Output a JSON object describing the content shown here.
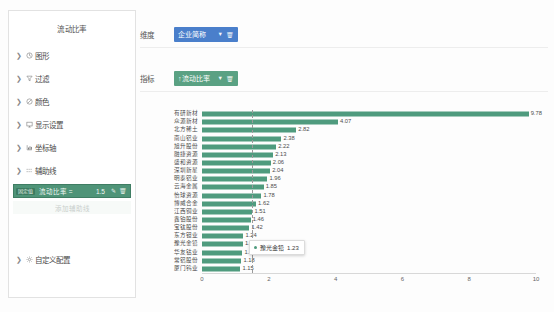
{
  "panel": {
    "title": "流动比率",
    "sections": [
      {
        "label": "图形",
        "icon": "shape-icon",
        "expanded": false
      },
      {
        "label": "过滤",
        "icon": "filter-icon",
        "expanded": false
      },
      {
        "label": "颜色",
        "icon": "color-icon",
        "expanded": false
      },
      {
        "label": "显示设置",
        "icon": "display-icon",
        "expanded": false
      },
      {
        "label": "坐标轴",
        "icon": "axis-icon",
        "expanded": false
      },
      {
        "label": "辅助线",
        "icon": "guideline-icon",
        "expanded": true
      }
    ],
    "rule": {
      "badge": "固定值",
      "expression": "流动比率 =",
      "value": "1.5",
      "edit_icon": "pencil-icon",
      "delete_icon": "trash-icon"
    },
    "add_rule_label": "添加辅助线",
    "custom_section": {
      "label": "自定义配置",
      "icon": "settings-icon",
      "expanded": false
    }
  },
  "fields": {
    "dimension_label": "维度",
    "dimension_chip": "企业简称",
    "metric_label": "指标",
    "metric_chip": "↑流动比率"
  },
  "tooltip": {
    "name": "豫光金铅",
    "value": "1.23"
  },
  "caption": "",
  "colors": {
    "bar": "#4f9b7e",
    "dimension_chip": "#4a7fcb",
    "metric_chip": "#5aa183",
    "rule_row": "#4f9478"
  },
  "chart_data": {
    "type": "bar",
    "orientation": "horizontal",
    "title": "",
    "xlabel": "",
    "ylabel": "",
    "xlim": [
      0,
      10
    ],
    "xticks": [
      0,
      2,
      4,
      6,
      8,
      10
    ],
    "grid": false,
    "reference_line": {
      "value": 1.5,
      "style": "dashed",
      "label": "流动比率 = 1.5"
    },
    "categories": [
      "有研新材",
      "众源新材",
      "北方稀土",
      "南山铝业",
      "旭升股份",
      "融捷资源",
      "盛和资源",
      "深圳新星",
      "明泰铝业",
      "云海金属",
      "怡球资源",
      "博威合金",
      "江西铜业",
      "鑫铂股份",
      "宝钛股份",
      "东方钽业",
      "豫光金铅",
      "华友钴业",
      "常铝股份",
      "厦门钨业"
    ],
    "values": [
      9.78,
      4.07,
      2.82,
      2.38,
      2.22,
      2.13,
      2.06,
      2.04,
      1.96,
      1.85,
      1.78,
      1.62,
      1.51,
      1.46,
      1.42,
      1.24,
      1.23,
      1.21,
      1.18,
      1.15
    ],
    "series": [
      {
        "name": "流动比率",
        "color": "#4f9b7e"
      }
    ]
  }
}
